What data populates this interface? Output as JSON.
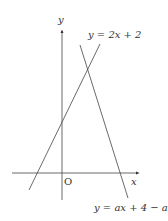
{
  "diagram": {
    "type": "coordinate-graph",
    "axes": {
      "x_label": "x",
      "y_label": "y",
      "origin_label": "O"
    },
    "lines": [
      {
        "label": "y = 2x + 2",
        "color": "#444444"
      },
      {
        "label": "y = ax + 4 − a",
        "color": "#444444"
      }
    ]
  }
}
